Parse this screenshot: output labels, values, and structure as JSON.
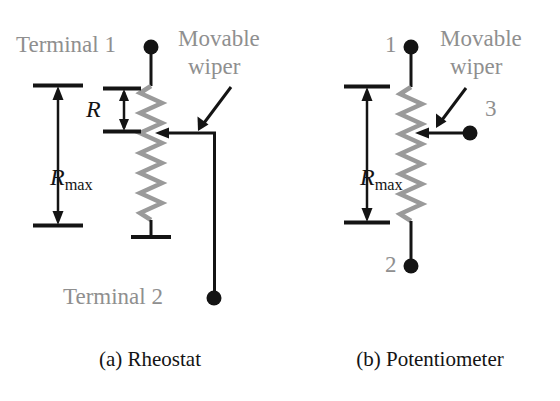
{
  "figure": {
    "background_color": "#ffffff",
    "wire_color": "#141414",
    "resistor_color": "#9a9a9a",
    "label_gray": "#8f8f8f",
    "label_dark": "#141414"
  },
  "panels": [
    {
      "id": "rheostat",
      "caption": "(a) Rheostat",
      "labels": {
        "terminal_top": "Terminal 1",
        "terminal_bottom": "Terminal 2",
        "wiper_line1": "Movable",
        "wiper_line2": "wiper",
        "dimension_full": "R",
        "dimension_full_sub": "max",
        "dimension_partial": "R"
      }
    },
    {
      "id": "potentiometer",
      "caption": "(b) Potentiometer",
      "labels": {
        "terminal_top": "1",
        "terminal_bottom": "2",
        "terminal_wiper": "3",
        "wiper_line1": "Movable",
        "wiper_line2": "wiper",
        "dimension_full": "R",
        "dimension_full_sub": "max"
      }
    }
  ]
}
